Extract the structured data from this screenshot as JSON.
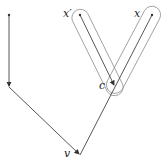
{
  "diagram": {
    "type": "graph",
    "nodes": [
      {
        "id": "top-left",
        "label": "",
        "x": 9,
        "y": 15
      },
      {
        "id": "mid-left",
        "label": "",
        "x": 9,
        "y": 87
      },
      {
        "id": "v",
        "label": "v",
        "x": 80,
        "y": 155
      },
      {
        "id": "c",
        "label": "c",
        "x": 115,
        "y": 86
      },
      {
        "id": "x-prime",
        "label": "x′",
        "x": 80,
        "y": 15
      },
      {
        "id": "x",
        "label": "x",
        "x": 152,
        "y": 15
      }
    ],
    "edges": [
      {
        "from": "top-left",
        "to": "mid-left",
        "arrow": true
      },
      {
        "from": "mid-left",
        "to": "v",
        "arrow": true
      },
      {
        "from": "x-prime",
        "to": "c",
        "arrow": true
      },
      {
        "from": "x",
        "to": "v",
        "arrow": false
      }
    ],
    "groups": [
      {
        "name": "capsule-xprime-c",
        "members": [
          "x-prime",
          "c"
        ]
      },
      {
        "name": "capsule-x-c",
        "members": [
          "x",
          "c"
        ]
      }
    ],
    "labels": {
      "x_prime": "x′",
      "x": "x",
      "c": "c",
      "v": "v"
    },
    "colors": {
      "line": "#444444",
      "capsule": "#888888"
    }
  }
}
